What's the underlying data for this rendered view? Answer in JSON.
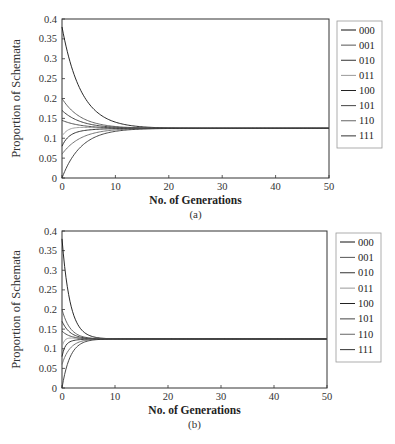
{
  "chart_data": [
    {
      "type": "line",
      "panel_label": "(a)",
      "title": "",
      "xlabel": "No. of Generations",
      "ylabel": "Proportion of Schemata",
      "xlim": [
        0,
        50
      ],
      "ylim": [
        0,
        0.4
      ],
      "x_ticks": [
        0,
        10,
        20,
        30,
        40,
        50
      ],
      "y_ticks": [
        0,
        0.05,
        0.1,
        0.15,
        0.2,
        0.25,
        0.3,
        0.35,
        0.4
      ],
      "grid": false,
      "legend_position": "right-outside",
      "converge_value": 0.125,
      "converge_generation": 15,
      "rate": 0.28,
      "series": [
        {
          "name": "000",
          "color": "#111111",
          "initial": 0.38
        },
        {
          "name": "001",
          "color": "#555555",
          "initial": 0.2
        },
        {
          "name": "010",
          "color": "#333333",
          "initial": 0.17
        },
        {
          "name": "011",
          "color": "#999999",
          "initial": 0.105
        },
        {
          "name": "100",
          "color": "#222222",
          "initial": 0.08
        },
        {
          "name": "101",
          "color": "#444444",
          "initial": 0.145
        },
        {
          "name": "110",
          "color": "#666666",
          "initial": 0.06
        },
        {
          "name": "111",
          "color": "#333333",
          "initial": 0.0
        }
      ]
    },
    {
      "type": "line",
      "panel_label": "(b)",
      "title": "",
      "xlabel": "No. of Generations",
      "ylabel": "Proportion of Schemata",
      "xlim": [
        0,
        50
      ],
      "ylim": [
        0,
        0.4
      ],
      "x_ticks": [
        0,
        10,
        20,
        30,
        40,
        50
      ],
      "y_ticks": [
        0,
        0.05,
        0.1,
        0.15,
        0.2,
        0.25,
        0.3,
        0.35,
        0.4
      ],
      "grid": false,
      "legend_position": "right-outside",
      "converge_value": 0.125,
      "converge_generation": 7,
      "rate": 0.65,
      "series": [
        {
          "name": "000",
          "color": "#111111",
          "initial": 0.38
        },
        {
          "name": "001",
          "color": "#555555",
          "initial": 0.2
        },
        {
          "name": "010",
          "color": "#333333",
          "initial": 0.17
        },
        {
          "name": "011",
          "color": "#999999",
          "initial": 0.105
        },
        {
          "name": "100",
          "color": "#222222",
          "initial": 0.08
        },
        {
          "name": "101",
          "color": "#444444",
          "initial": 0.145
        },
        {
          "name": "110",
          "color": "#666666",
          "initial": 0.06
        },
        {
          "name": "111",
          "color": "#333333",
          "initial": 0.0
        }
      ]
    }
  ],
  "panels": [
    {
      "label": "(a)",
      "xlabel": "No. of Generations",
      "ylabel": "Proportion of Schemata"
    },
    {
      "label": "(b)",
      "xlabel": "No. of Generations",
      "ylabel": "Proportion of Schemata"
    }
  ]
}
